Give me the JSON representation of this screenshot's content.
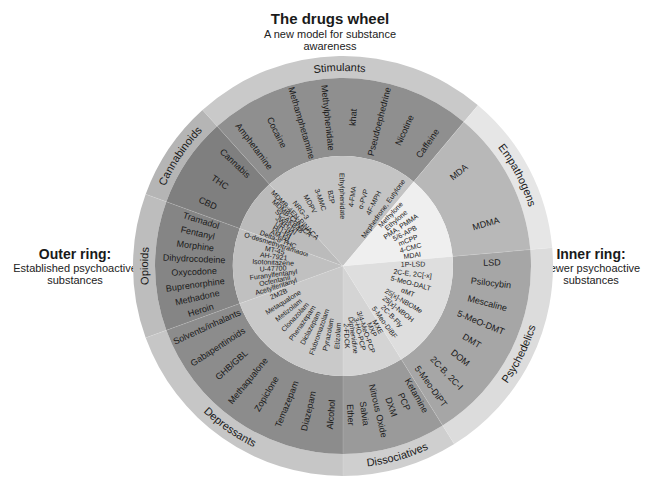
{
  "header": {
    "title": "The drugs wheel",
    "subtitle": "A new model for substance awareness"
  },
  "legend_left": {
    "heading": "Outer ring:",
    "description": "Established psychoactive substances"
  },
  "legend_right": {
    "heading": "Inner ring:",
    "description": "Newer psychoactive substances"
  },
  "wheel": {
    "center": [
      343,
      266
    ],
    "radii": {
      "inner": 110,
      "outer": 188,
      "label": 210
    },
    "categories": [
      {
        "name": "Stimulants",
        "start": -42,
        "end": 40,
        "colors": {
          "label": "#c9c9c9",
          "outer": "#8f8f8f",
          "inner": "#c4c4c4"
        },
        "outer_drugs": [
          "Amphetamine",
          "Cocaine",
          "Methamphetamine",
          "Methylphenidate",
          "khat",
          "Pseudoephedrine",
          "Nicotine",
          "Caffeine"
        ],
        "inner_drugs": [
          "NRG-3",
          "MDPV",
          "3-MMC",
          "BZP",
          "Ethylphenidate",
          "4-FMA",
          "α-PVP",
          "4F-MPH",
          "Mephedrone, Eutylone"
        ]
      },
      {
        "name": "Empathogens",
        "start": 40,
        "end": 85,
        "colors": {
          "label": "#e6e6e6",
          "outer": "#b8b8b8",
          "inner": "#efefef"
        },
        "outer_drugs": [
          "MDA",
          "MDMA"
        ],
        "inner_drugs": [
          "Methylone",
          "Ethylone",
          "PMA, PMMA",
          "5/6-APB",
          "mCPP",
          "4-CMC",
          "MDAI"
        ]
      },
      {
        "name": "Psychedelics",
        "start": 85,
        "end": 148,
        "colors": {
          "label": "#dcdcdc",
          "outer": "#a6a6a6",
          "inner": "#dedede"
        },
        "outer_drugs": [
          "LSD",
          "Psilocybin",
          "Mescaline",
          "5-MeO-DMT",
          "DMT",
          "DOM",
          "2C-B, 2C-I",
          "5-Meo-DiPT"
        ],
        "inner_drugs": [
          "1P-LSD",
          "2C-E, 2C[-x]",
          "5-MeO-DALT",
          "αMT",
          "25[x]-NBOMe",
          "25[x]-NBOH",
          "2C-B-Fly",
          "5-Meo-DiBF"
        ]
      },
      {
        "name": "Dissociatives",
        "start": 148,
        "end": 180,
        "colors": {
          "label": "#cfcfcf",
          "outer": "#9a9a9a",
          "inner": "#d4d4d4"
        },
        "outer_drugs": [
          "Ketamine",
          "PCP",
          "DXM",
          "Nitrous Oxide",
          "Salvia",
          "Ether"
        ],
        "inner_drugs": [
          "MXE",
          "MXP",
          "3/4-MeO-PCP",
          "3-HO-PCP",
          "Diphenidine",
          "2-FDCK"
        ]
      },
      {
        "name": "Depressants",
        "start": 180,
        "end": 250,
        "colors": {
          "label": "#c6c6c6",
          "outer": "#8c8c8c",
          "inner": "#c9c9c9"
        },
        "outer_drugs": [
          "Alcohol",
          "Diazepam",
          "Temazepam",
          "Zopiclone",
          "Methaqualone",
          "GHB/GBL",
          "Gabapentinoids",
          "Solvents/inhalants"
        ],
        "inner_drugs": [
          "Etizolam",
          "Pyrazolam",
          "Flubromazolam",
          "Diclazepam",
          "Phenazepam",
          "Clonazolam",
          "Metizolam",
          "Metaqualone",
          "2M2B"
        ]
      },
      {
        "name": "Opioids",
        "start": 250,
        "end": 290,
        "colors": {
          "label": "#bdbdbd",
          "outer": "#858585",
          "inner": "#c0c0c0"
        },
        "outer_drugs": [
          "Heroin",
          "Methadone",
          "Buprenorphine",
          "Oxycodone",
          "Dihydrocodeine",
          "Morphine",
          "Fentanyl",
          "Tramadol"
        ],
        "inner_drugs": [
          "Acetylfentanyl",
          "Ocfentanil",
          "Furanylfentanyl",
          "U-47700",
          "Isotonitazene",
          "AH-7921",
          "MT-45",
          "O-desmethyltramadol"
        ]
      },
      {
        "name": "Cannabinoids",
        "start": 290,
        "end": 318,
        "colors": {
          "label": "#b5b5b5",
          "outer": "#7f7f7f",
          "inner": "#bbbbbb"
        },
        "outer_drugs": [
          "CBD",
          "THC",
          "Cannabis"
        ],
        "inner_drugs": [
          "Delta-8 THC",
          "AM-[x]",
          "HU-[x]",
          "UR-[x]",
          "JWH-[x]",
          "SC-AKB48",
          "MDMB-CHMICA",
          "MDMB-4EN-PINACA"
        ]
      }
    ]
  }
}
